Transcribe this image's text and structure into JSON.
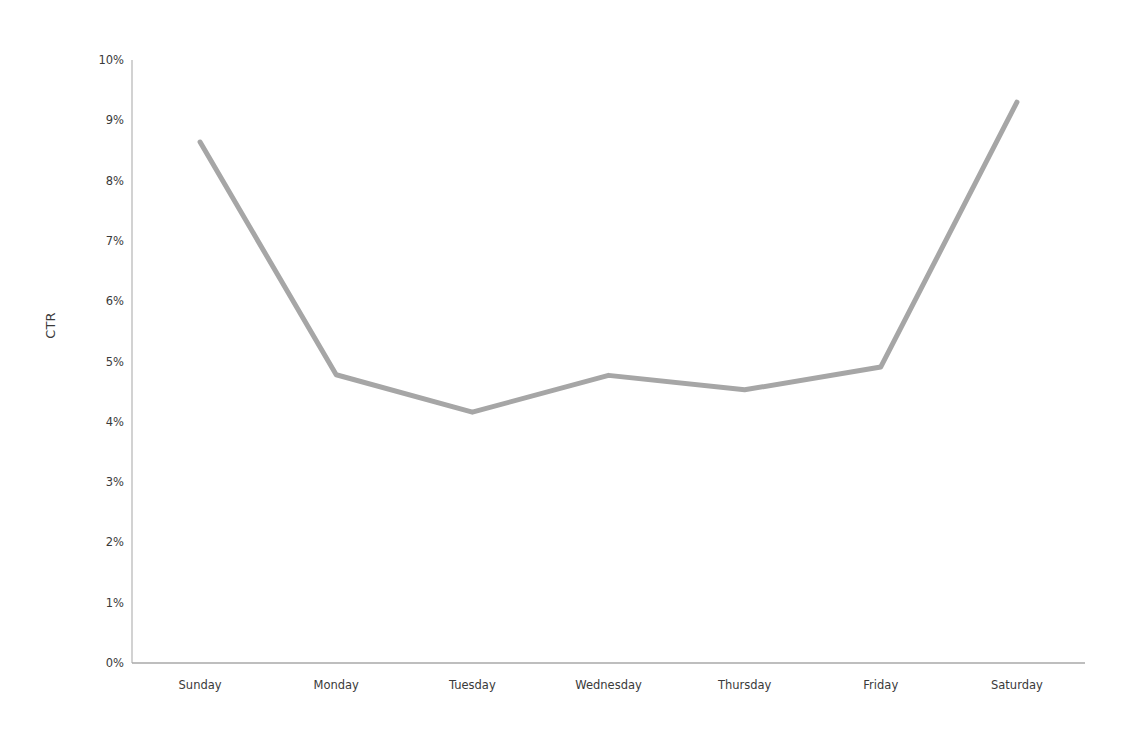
{
  "chart_data": {
    "type": "line",
    "title": "",
    "xlabel": "",
    "ylabel": "CTR",
    "categories": [
      "Sunday",
      "Monday",
      "Tuesday",
      "Wednesday",
      "Thursday",
      "Friday",
      "Saturday"
    ],
    "values": [
      8.64,
      4.78,
      4.16,
      4.77,
      4.53,
      4.91,
      9.3
    ],
    "series": [
      {
        "name": "CTR",
        "values": [
          8.64,
          4.78,
          4.16,
          4.77,
          4.53,
          4.91,
          9.3
        ],
        "color": "#a6a6a6"
      }
    ],
    "ylim": [
      0,
      10
    ],
    "ytick_values": [
      0,
      1,
      2,
      3,
      4,
      5,
      6,
      7,
      8,
      9,
      10
    ],
    "ytick_labels": [
      "0%",
      "1%",
      "2%",
      "3%",
      "4%",
      "5%",
      "6%",
      "7%",
      "8%",
      "9%",
      "10%"
    ],
    "value_unit": "%",
    "grid": false,
    "legend": false,
    "legend_position": "none",
    "axis_color": "#bfbfbf",
    "text_color": "#3a3a3a",
    "background_color": "#ffffff",
    "line_width": 5
  },
  "axes": {
    "y_title": "CTR"
  }
}
